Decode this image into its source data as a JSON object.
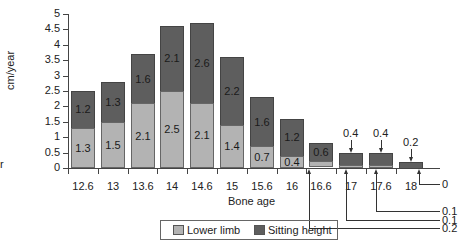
{
  "chart_data": {
    "type": "bar",
    "stacked": true,
    "title": "",
    "xlabel": "Bone age",
    "ylabel": "cm/year",
    "ylim": [
      0,
      5
    ],
    "yticks": [
      "0",
      "0.5",
      "1",
      "1.5",
      "2",
      "2.5",
      "3",
      "3.5",
      "4",
      "4.5",
      "5"
    ],
    "categories": [
      "12.6",
      "13",
      "13.6",
      "14",
      "14.6",
      "15",
      "15.6",
      "16",
      "16.6",
      "17",
      "17.6",
      "18"
    ],
    "series": [
      {
        "name": "Lower limb",
        "color": "#b3b3b3",
        "values": [
          1.3,
          1.5,
          2.1,
          2.5,
          2.1,
          1.4,
          0.7,
          0.4,
          0.2,
          0.1,
          0.1,
          0
        ]
      },
      {
        "name": "Sitting height",
        "color": "#5e5e5e",
        "values": [
          1.2,
          1.3,
          1.6,
          2.1,
          2.6,
          2.2,
          1.6,
          1.2,
          0.6,
          0.4,
          0.4,
          0.2
        ]
      }
    ],
    "legend": {
      "position": "bottom",
      "entries": [
        "Lower limb",
        "Sitting height"
      ]
    },
    "grid": false,
    "annotations": {
      "sitting_callouts": [
        {
          "category": "17",
          "text": "0.4"
        },
        {
          "category": "17.6",
          "text": "0.4"
        },
        {
          "category": "18",
          "text": "0.2"
        }
      ],
      "lower_callouts": [
        {
          "category": "18",
          "text": "0"
        },
        {
          "category": "17.6",
          "text": "0.1"
        },
        {
          "category": "17",
          "text": "0.1"
        },
        {
          "category": "16.6",
          "text": "0.2"
        }
      ]
    }
  },
  "labels": {
    "ylabel": "cm/year",
    "xtitle": "Bone age",
    "legend_lower": "Lower limb",
    "legend_sitting": "Sitting height",
    "edge_fragment": "r"
  }
}
